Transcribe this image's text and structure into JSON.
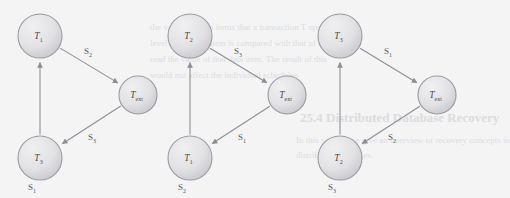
{
  "figure": {
    "type": "precedence-graph-set",
    "background_color": "#f4f4f5",
    "node_fill_light": "#f0f0f1",
    "node_fill_dark": "#c6c6cb",
    "node_stroke": "#9a9aa1",
    "edge_color": "#8e8e96",
    "text_color": "#4b4b4f",
    "bleed_color": "#dcdcde"
  },
  "bleed_text": [
    {
      "text": "25.4   Distributed Database Recovery",
      "x": 300,
      "y": 110,
      "size": 13,
      "weight": "bold"
    },
    {
      "text": "In this section we give an overview of recovery concepts in",
      "x": 296,
      "y": 135,
      "size": 9,
      "weight": "normal"
    },
    {
      "text": "distributed databases.",
      "x": 296,
      "y": 150,
      "size": 9,
      "weight": "normal"
    },
    {
      "text": "the values of data items that a transaction T updates",
      "x": 150,
      "y": 22,
      "size": 9,
      "weight": "normal"
    },
    {
      "text": "level of the data item is compared with that of the",
      "x": 150,
      "y": 38,
      "size": 9,
      "weight": "normal"
    },
    {
      "text": "read the value of that data item. The result of this",
      "x": 150,
      "y": 54,
      "size": 9,
      "weight": "normal"
    },
    {
      "text": "would not affect the individual schedules",
      "x": 150,
      "y": 70,
      "size": 9,
      "weight": "normal"
    }
  ],
  "diagrams": [
    {
      "name": "schedule-s1",
      "nodes": [
        {
          "id": "top",
          "label": "T",
          "sub": "1",
          "cx": 40,
          "cy": 36,
          "r": 22
        },
        {
          "id": "right",
          "label": "T",
          "sub": "ext",
          "cx": 138,
          "cy": 95,
          "r": 19
        },
        {
          "id": "bottom",
          "label": "T",
          "sub": "3",
          "cx": 40,
          "cy": 158,
          "r": 22
        }
      ],
      "edges": [
        {
          "from": "top",
          "to": "right",
          "label": "S",
          "sub": "2",
          "lx": 88,
          "ly": 54
        },
        {
          "from": "right",
          "to": "bottom",
          "label": "S",
          "sub": "3",
          "lx": 92,
          "ly": 140
        },
        {
          "from": "bottom",
          "to": "top",
          "label": "",
          "sub": "",
          "lx": 0,
          "ly": 0
        }
      ],
      "caption": {
        "label": "S",
        "sub": "1",
        "x": 32,
        "y": 190
      }
    },
    {
      "name": "schedule-s2",
      "nodes": [
        {
          "id": "top",
          "label": "T",
          "sub": "2",
          "cx": 190,
          "cy": 36,
          "r": 22
        },
        {
          "id": "right",
          "label": "T",
          "sub": "ext",
          "cx": 287,
          "cy": 95,
          "r": 19
        },
        {
          "id": "bottom",
          "label": "T",
          "sub": "1",
          "cx": 190,
          "cy": 158,
          "r": 22
        }
      ],
      "edges": [
        {
          "from": "top",
          "to": "right",
          "label": "S",
          "sub": "3",
          "lx": 238,
          "ly": 54
        },
        {
          "from": "right",
          "to": "bottom",
          "label": "S",
          "sub": "1",
          "lx": 242,
          "ly": 140
        },
        {
          "from": "bottom",
          "to": "top",
          "label": "",
          "sub": "",
          "lx": 0,
          "ly": 0
        }
      ],
      "caption": {
        "label": "S",
        "sub": "2",
        "x": 182,
        "y": 190
      }
    },
    {
      "name": "schedule-s3",
      "nodes": [
        {
          "id": "top",
          "label": "T",
          "sub": "3",
          "cx": 340,
          "cy": 36,
          "r": 22
        },
        {
          "id": "right",
          "label": "T",
          "sub": "ext",
          "cx": 437,
          "cy": 95,
          "r": 19
        },
        {
          "id": "bottom",
          "label": "T",
          "sub": "2",
          "cx": 340,
          "cy": 158,
          "r": 22
        }
      ],
      "edges": [
        {
          "from": "top",
          "to": "right",
          "label": "S",
          "sub": "1",
          "lx": 388,
          "ly": 54
        },
        {
          "from": "right",
          "to": "bottom",
          "label": "S",
          "sub": "2",
          "lx": 392,
          "ly": 140
        },
        {
          "from": "bottom",
          "to": "top",
          "label": "",
          "sub": "",
          "lx": 0,
          "ly": 0
        }
      ],
      "caption": {
        "label": "S",
        "sub": "3",
        "x": 332,
        "y": 190
      }
    }
  ]
}
